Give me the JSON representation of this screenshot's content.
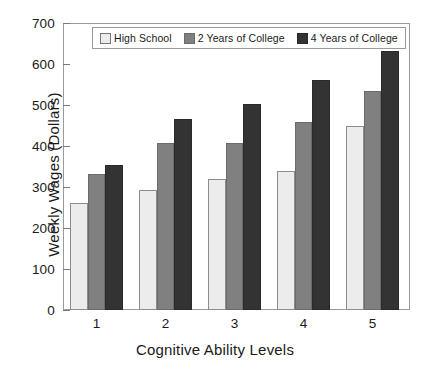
{
  "chart_data": {
    "type": "bar",
    "title": "",
    "xlabel": "Cognitive Ability Levels",
    "ylabel": "Weekly Wages (Dollars)",
    "categories": [
      "1",
      "2",
      "3",
      "4",
      "5"
    ],
    "ylim": [
      0,
      700
    ],
    "yticks": [
      0,
      100,
      200,
      300,
      400,
      500,
      600,
      700
    ],
    "ytick_labels": [
      "0",
      "100",
      "200",
      "300",
      "400",
      "500",
      "600",
      "700"
    ],
    "grid": false,
    "legend_position": "top-center-inside",
    "series": [
      {
        "name": "High School",
        "color": "#ececec",
        "values": [
          263,
          295,
          323,
          342,
          453
        ]
      },
      {
        "name": "2 Years of College",
        "color": "#808080",
        "values": [
          334,
          409,
          411,
          463,
          539
        ]
      },
      {
        "name": "4 Years of College",
        "color": "#333333",
        "values": [
          357,
          468,
          507,
          566,
          636
        ]
      }
    ]
  },
  "legend": {
    "items": [
      {
        "label": "High School"
      },
      {
        "label": "2 Years of College"
      },
      {
        "label": "4 Years of College"
      }
    ]
  }
}
